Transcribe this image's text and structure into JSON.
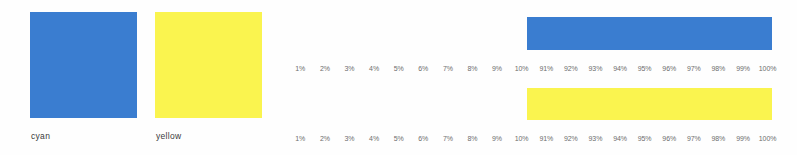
{
  "swatches": {
    "items": [
      {
        "name": "cyan",
        "label": "cyan",
        "color": "#3a7dd0"
      },
      {
        "name": "yellow",
        "label": "yellow",
        "color": "#faf44f"
      }
    ]
  },
  "ramps": {
    "items": [
      {
        "name": "cyan-ramp",
        "color": "#3a7dd0"
      },
      {
        "name": "yellow-ramp",
        "color": "#faf44f"
      }
    ]
  },
  "tick_rows": {
    "top": [
      "1%",
      "2%",
      "3%",
      "4%",
      "5%",
      "6%",
      "7%",
      "8%",
      "9%",
      "10%",
      "91%",
      "92%",
      "93%",
      "94%",
      "95%",
      "96%",
      "97%",
      "98%",
      "99%",
      "100%"
    ],
    "bottom": [
      "1%",
      "2%",
      "3%",
      "4%",
      "5%",
      "6%",
      "7%",
      "8%",
      "9%",
      "10%",
      "91%",
      "92%",
      "93%",
      "94%",
      "95%",
      "96%",
      "97%",
      "98%",
      "99%",
      "100%"
    ]
  },
  "chart_data": {
    "type": "bar",
    "title": "",
    "subtitle": "",
    "xlabel": "",
    "ylabel": "",
    "grid": false,
    "legend_position": "left",
    "categories": [
      "1%",
      "2%",
      "3%",
      "4%",
      "5%",
      "6%",
      "7%",
      "8%",
      "9%",
      "10%",
      "91%",
      "92%",
      "93%",
      "94%",
      "95%",
      "96%",
      "97%",
      "98%",
      "99%",
      "100%"
    ],
    "series": [
      {
        "name": "cyan",
        "color": "#3a7dd0",
        "values": [
          1,
          2,
          3,
          4,
          5,
          6,
          7,
          8,
          9,
          10,
          91,
          92,
          93,
          94,
          95,
          96,
          97,
          98,
          99,
          100
        ]
      },
      {
        "name": "yellow",
        "color": "#faf44f",
        "values": [
          1,
          2,
          3,
          4,
          5,
          6,
          7,
          8,
          9,
          10,
          91,
          92,
          93,
          94,
          95,
          96,
          97,
          98,
          99,
          100
        ]
      }
    ],
    "ylim": [
      0,
      100
    ],
    "legend_entries": [
      "cyan",
      "yellow"
    ]
  }
}
